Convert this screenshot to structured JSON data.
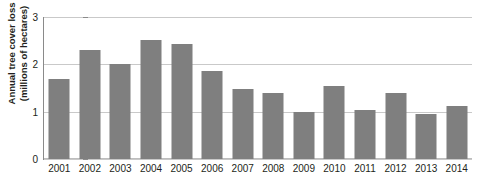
{
  "chart_data": {
    "type": "bar",
    "title": "Annual tree cover loss",
    "subtitle": "",
    "xlabel": "",
    "ylabel_line1": "Annual tree cover loss",
    "ylabel_line2": "(millions of hectares)",
    "categories": [
      "2001",
      "2002",
      "2003",
      "2004",
      "2005",
      "2006",
      "2007",
      "2008",
      "2009",
      "2010",
      "2011",
      "2012",
      "2013",
      "2014"
    ],
    "values": [
      1.69,
      2.3,
      2.01,
      2.52,
      2.43,
      1.85,
      1.48,
      1.39,
      1.0,
      1.54,
      1.03,
      1.4,
      0.95,
      1.11
    ],
    "ylim": [
      0,
      3
    ],
    "yticks": [
      "0",
      "1",
      "2",
      "3"
    ],
    "ytick_values": [
      0,
      1,
      2,
      3
    ],
    "grid": true,
    "legend": false,
    "legend_position": "none",
    "bar_color": "#7f7f7f",
    "gridline_color": "#c9c9c9",
    "axis_color": "#8a8a8a",
    "text_color": "#231f20",
    "background_color": "#ffffff"
  }
}
